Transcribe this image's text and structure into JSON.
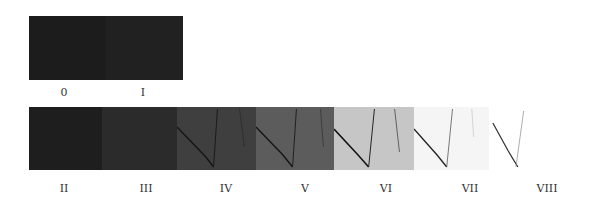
{
  "figure": {
    "top_row": {
      "panels": [
        {
          "label": "0",
          "shade": "#1c1c1c"
        },
        {
          "label": "I",
          "shade": "#202020"
        }
      ]
    },
    "bottom_row": {
      "panels": [
        {
          "label": "II",
          "shade": "#1e1e1e",
          "crack_color": "#151515",
          "crack_opacity": 0.0
        },
        {
          "label": "III",
          "shade": "#2a2a2a",
          "crack_color": "#151515",
          "crack_opacity": 0.2
        },
        {
          "label": "IV",
          "shade": "#3e3e3e",
          "crack_color": "#111111",
          "crack_opacity": 0.7
        },
        {
          "label": "V",
          "shade": "#5a5a5a",
          "crack_color": "#111111",
          "crack_opacity": 0.8
        },
        {
          "label": "VI",
          "shade": "#c4c4c4",
          "crack_color": "#111111",
          "crack_opacity": 0.9
        },
        {
          "label": "VII",
          "shade": "#f4f4f4",
          "crack_color": "#222222",
          "crack_opacity": 0.9
        },
        {
          "label": "VIII",
          "shade": "#ffffff",
          "crack_color": "#333333",
          "crack_opacity": 0.85
        }
      ]
    }
  }
}
